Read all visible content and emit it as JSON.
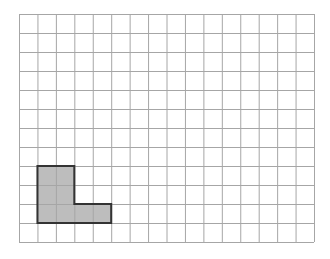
{
  "diagram": {
    "type": "grid-with-shaded-shape",
    "grid": {
      "columns": 16,
      "rows": 12,
      "origin_x": 19,
      "origin_y": 14,
      "width": 295,
      "height": 228,
      "line_color": "#a6a6a6",
      "line_width": 1
    },
    "shape": {
      "name": "L-shape",
      "fill_color": "#bdbdbd",
      "stroke_color": "#333333",
      "stroke_width": 2,
      "cells": [
        {
          "col": 1,
          "row": 8
        },
        {
          "col": 2,
          "row": 8
        },
        {
          "col": 1,
          "row": 9
        },
        {
          "col": 2,
          "row": 9
        },
        {
          "col": 1,
          "row": 10
        },
        {
          "col": 2,
          "row": 10
        },
        {
          "col": 3,
          "row": 10
        },
        {
          "col": 4,
          "row": 10
        }
      ],
      "outline_cells": [
        [
          1,
          8
        ],
        [
          3,
          8
        ],
        [
          3,
          10
        ],
        [
          5,
          10
        ],
        [
          5,
          11
        ],
        [
          1,
          11
        ]
      ],
      "area_units": 8
    }
  }
}
